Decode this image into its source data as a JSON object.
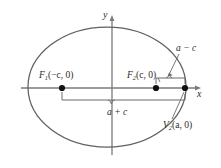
{
  "figure": {
    "type": "ellipse-focus-diagram",
    "colors": {
      "background": "#ffffff",
      "curve": "#595959",
      "axis": "#6e6e6e",
      "marker": "#1a1a1a",
      "text": "#2b2b2b",
      "leader": "#5a5a5a"
    },
    "axes": {
      "x_label": "x",
      "y_label": "y",
      "origin": {
        "x": 112,
        "y": 88
      }
    },
    "ellipse": {
      "center_x": 107,
      "center_y": 87,
      "semi_major_px": 79,
      "semi_minor_px": 60
    },
    "points": [
      {
        "name": "focus-1",
        "label_main": "F",
        "label_sub": "1",
        "label_coords": "(−c, 0)",
        "x": 62,
        "y": 88
      },
      {
        "name": "focus-2",
        "label_main": "F",
        "label_sub": "2",
        "label_coords": "(c, 0)",
        "x": 156,
        "y": 88
      },
      {
        "name": "vertex-2",
        "label_main": "V",
        "label_sub": "2",
        "label_coords": "(a, 0)",
        "x": 185,
        "y": 88
      }
    ],
    "measures": [
      {
        "name": "a-plus-c",
        "text": "a + c",
        "from": "focus-1",
        "to": "vertex-2"
      },
      {
        "name": "a-minus-c",
        "text": "a − c",
        "from": "focus-2",
        "to": "vertex-2"
      }
    ],
    "labels": {
      "y_axis": "y",
      "x_axis": "x",
      "f1_main": "F",
      "f1_sub": "1",
      "f1_coords": "(−c, 0)",
      "f2_main": "F",
      "f2_sub": "2",
      "f2_coords": "(c, 0)",
      "v2_main": "V",
      "v2_sub": "2",
      "v2_coords": "(a, 0)",
      "a_plus_c": "a + c",
      "a_minus_c": "a − c"
    }
  }
}
